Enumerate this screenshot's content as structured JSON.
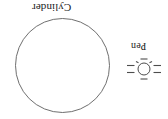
{
  "figure": {
    "background_color": "#ffffff",
    "width": 168,
    "height": 119,
    "orientation_note": "rotated-180",
    "stroke_color": "#595959",
    "text_color": "#1a1a1a"
  },
  "cylinder": {
    "label": "Cylinder",
    "shape_name": "large-circle",
    "center_x": 62.5,
    "center_y": 65.5,
    "radius": 47
  },
  "pen": {
    "label": "Pen",
    "shape_name": "small-circle-with-rays",
    "center_x": 144,
    "center_y": 69,
    "radius": 6,
    "ray_count": 8
  }
}
